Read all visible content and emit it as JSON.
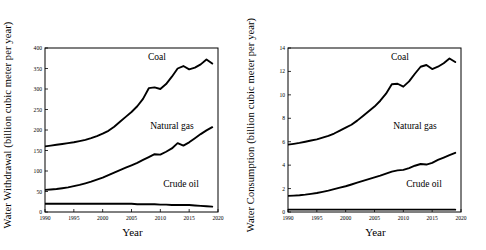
{
  "figure": {
    "panels": [
      {
        "id": "withdrawal",
        "ylabel": "Water Withdrawal (billion cubic meter per year)",
        "xlabel": "Year",
        "annotations": {
          "coal": "Coal",
          "natural_gas": "Natural gas",
          "crude_oil": "Crude oil"
        }
      },
      {
        "id": "consumption",
        "ylabel": "Water Consumption (billion cubic meter per year)",
        "xlabel": "Year",
        "annotations": {
          "coal": "Coal",
          "natural_gas": "Natural gas",
          "crude_oil": "Crude oil"
        }
      }
    ]
  },
  "chart_data": [
    {
      "type": "line",
      "id": "withdrawal",
      "title": "",
      "xlabel": "Year",
      "ylabel": "Water Withdrawal (billion cubic meter per year)",
      "xlim": [
        1990,
        2020
      ],
      "ylim": [
        0,
        400
      ],
      "xticks": [
        1990,
        1995,
        2000,
        2005,
        2010,
        2015,
        2020
      ],
      "yticks": [
        0,
        50,
        100,
        150,
        200,
        250,
        300,
        350,
        400
      ],
      "grid": false,
      "legend": "inline-annotations",
      "x": [
        1990,
        1991,
        1992,
        1993,
        1994,
        1995,
        1996,
        1997,
        1998,
        1999,
        2000,
        2001,
        2002,
        2003,
        2004,
        2005,
        2006,
        2007,
        2008,
        2009,
        2010,
        2011,
        2012,
        2013,
        2014,
        2015,
        2016,
        2017,
        2018,
        2019
      ],
      "series": [
        {
          "name": "Coal",
          "values": [
            160,
            162,
            164,
            166,
            168,
            170,
            173,
            176,
            180,
            185,
            191,
            198,
            208,
            220,
            232,
            244,
            258,
            276,
            302,
            304,
            300,
            312,
            330,
            350,
            356,
            348,
            352,
            360,
            372,
            362
          ]
        },
        {
          "name": "Natural gas",
          "values": [
            54,
            55,
            56,
            58,
            60,
            63,
            66,
            70,
            74,
            79,
            84,
            90,
            96,
            102,
            108,
            114,
            120,
            127,
            134,
            141,
            140,
            147,
            155,
            168,
            162,
            170,
            180,
            190,
            199,
            207
          ]
        },
        {
          "name": "Crude oil",
          "values": [
            20,
            20,
            20,
            20,
            20,
            20,
            20,
            20,
            20,
            20,
            20,
            20,
            20,
            20,
            20,
            20,
            19,
            19,
            19,
            19,
            18,
            18,
            17,
            17,
            17,
            17,
            16,
            15,
            14,
            13
          ]
        }
      ]
    },
    {
      "type": "line",
      "id": "consumption",
      "title": "",
      "xlabel": "Year",
      "ylabel": "Water Consumption (billion cubic meter per year)",
      "xlim": [
        1990,
        2020
      ],
      "ylim": [
        0,
        14
      ],
      "xticks": [
        1990,
        1995,
        2000,
        2005,
        2010,
        2015,
        2020
      ],
      "yticks": [
        0,
        2,
        4,
        6,
        8,
        10,
        12,
        14
      ],
      "grid": false,
      "legend": "inline-annotations",
      "x": [
        1990,
        1991,
        1992,
        1993,
        1994,
        1995,
        1996,
        1997,
        1998,
        1999,
        2000,
        2001,
        2002,
        2003,
        2004,
        2005,
        2006,
        2007,
        2008,
        2009,
        2010,
        2011,
        2012,
        2013,
        2014,
        2015,
        2016,
        2017,
        2018,
        2019
      ],
      "series": [
        {
          "name": "Coal",
          "values": [
            5.75,
            5.82,
            5.9,
            6.0,
            6.1,
            6.2,
            6.35,
            6.5,
            6.7,
            6.95,
            7.2,
            7.45,
            7.8,
            8.2,
            8.6,
            9.0,
            9.5,
            10.1,
            10.9,
            10.95,
            10.7,
            11.15,
            11.8,
            12.4,
            12.55,
            12.2,
            12.4,
            12.7,
            13.1,
            12.8
          ]
        },
        {
          "name": "Natural gas",
          "values": [
            1.38,
            1.4,
            1.43,
            1.48,
            1.55,
            1.62,
            1.72,
            1.82,
            1.95,
            2.08,
            2.2,
            2.35,
            2.5,
            2.65,
            2.8,
            2.95,
            3.1,
            3.28,
            3.45,
            3.55,
            3.6,
            3.75,
            3.95,
            4.1,
            4.05,
            4.2,
            4.45,
            4.65,
            4.85,
            5.05
          ]
        },
        {
          "name": "Crude oil",
          "values": [
            0.2,
            0.2,
            0.2,
            0.2,
            0.2,
            0.2,
            0.2,
            0.2,
            0.2,
            0.2,
            0.2,
            0.2,
            0.2,
            0.2,
            0.2,
            0.2,
            0.2,
            0.2,
            0.2,
            0.2,
            0.2,
            0.2,
            0.2,
            0.2,
            0.2,
            0.2,
            0.2,
            0.2,
            0.2,
            0.2
          ]
        }
      ]
    }
  ]
}
